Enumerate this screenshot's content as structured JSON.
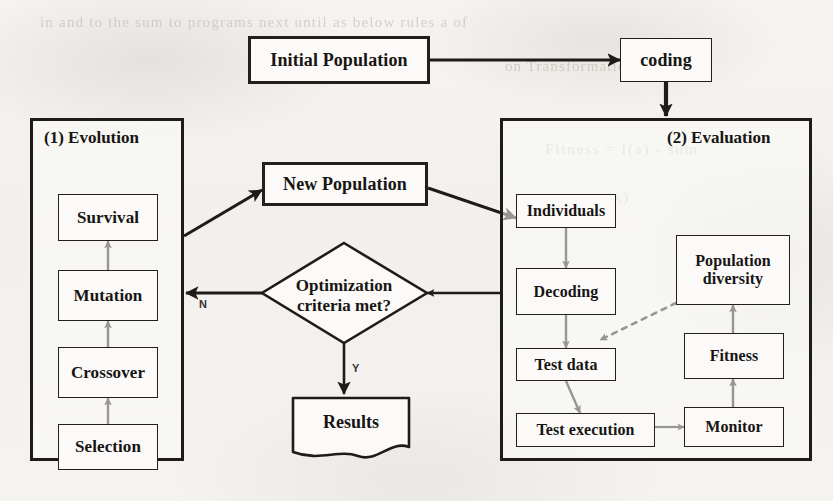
{
  "figure": {
    "background_color": "#f3f2ef",
    "ink_color": "#201b18",
    "box_fill": "#fbfaf8"
  },
  "nodes": {
    "initial_population": {
      "label": "Initial Population"
    },
    "coding": {
      "label": "coding"
    },
    "new_population": {
      "label": "New Population"
    },
    "decision": {
      "line1": "Optimization",
      "line2": "criteria met?"
    },
    "results": {
      "label": "Results"
    },
    "evolution_panel": {
      "title": "(1) Evolution"
    },
    "evaluation_panel": {
      "title": "(2) Evaluation"
    },
    "survival": {
      "label": "Survival"
    },
    "mutation": {
      "label": "Mutation"
    },
    "crossover": {
      "label": "Crossover"
    },
    "selection": {
      "label": "Selection"
    },
    "individuals": {
      "label": "Individuals"
    },
    "decoding": {
      "label": "Decoding"
    },
    "test_data": {
      "label": "Test data"
    },
    "test_execution": {
      "label": "Test execution"
    },
    "monitor": {
      "label": "Monitor"
    },
    "fitness": {
      "label": "Fitness"
    },
    "population_diversity": {
      "line1": "Population",
      "line2": "diversity"
    }
  },
  "edge_labels": {
    "no_branch": "N",
    "yes_branch": "Y"
  },
  "ghost_text": {
    "line1": "in and to the sum  to programs    next   until  as  below  rules  a  of",
    "line2": "on   Transformation",
    "line3": "Fitness  =  f(a)  -  sum",
    "line4": "x  +  pr(x)"
  }
}
